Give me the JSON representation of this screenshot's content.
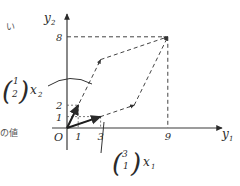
{
  "side_text": {
    "top_fragment": "い",
    "middle_fragment": "の値"
  },
  "axes": {
    "x_label": "y",
    "x_label_sub": "1",
    "y_label": "y",
    "y_label_sub": "2",
    "origin_label": "O"
  },
  "ticks": {
    "x": [
      {
        "value": 1,
        "label": "1"
      },
      {
        "value": 3,
        "label": "3"
      },
      {
        "value": 9,
        "label": "9"
      }
    ],
    "y": [
      {
        "value": 1,
        "label": "1"
      },
      {
        "value": 2,
        "label": "2"
      },
      {
        "value": 8,
        "label": "8"
      }
    ]
  },
  "vectors": [
    {
      "name": "x2",
      "components": [
        1,
        2
      ],
      "label_top": "1",
      "label_bottom": "2",
      "coeff_label": "x",
      "coeff_sub": "2",
      "multiple": 3
    },
    {
      "name": "x1",
      "components": [
        3,
        1
      ],
      "label_top": "3",
      "label_bottom": "1",
      "coeff_label": "x",
      "coeff_sub": "1",
      "multiple": 2
    }
  ],
  "target_point": [
    9,
    8
  ],
  "parallelogram_vertices": [
    [
      0,
      0
    ],
    [
      3,
      6
    ],
    [
      9,
      8
    ],
    [
      6,
      2
    ]
  ]
}
